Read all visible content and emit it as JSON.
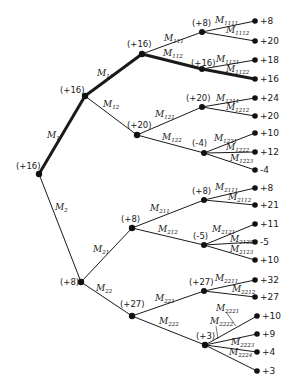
{
  "diagram": {
    "type": "game-tree",
    "root": {
      "id": "root",
      "value": "(+16)"
    },
    "nodes": [
      {
        "id": "root",
        "value": "(+16)",
        "x": 39,
        "y": 174
      },
      {
        "id": "n1",
        "value": "(+16)",
        "x": 85,
        "y": 96
      },
      {
        "id": "n11",
        "value": "(+16)",
        "x": 142,
        "y": 54
      },
      {
        "id": "n111",
        "value": "(+8)",
        "x": 202,
        "y": 32
      },
      {
        "id": "n112",
        "value": "(+16)",
        "x": 202,
        "y": 69
      },
      {
        "id": "n12",
        "value": "(+20)",
        "x": 137,
        "y": 135
      },
      {
        "id": "n121",
        "value": "(+20)",
        "x": 202,
        "y": 107
      },
      {
        "id": "n122",
        "value": "(-4)",
        "x": 204,
        "y": 153
      },
      {
        "id": "n2",
        "value": "(+8)",
        "x": 81,
        "y": 282
      },
      {
        "id": "n21",
        "value": "(+8)",
        "x": 132,
        "y": 228
      },
      {
        "id": "n211",
        "value": "(+8)",
        "x": 204,
        "y": 200
      },
      {
        "id": "n212",
        "value": "(-5)",
        "x": 204,
        "y": 245
      },
      {
        "id": "n22",
        "value": "(+27)",
        "x": 132,
        "y": 316
      },
      {
        "id": "n221",
        "value": "(+27)",
        "x": 204,
        "y": 291
      },
      {
        "id": "n222",
        "value": "(+3)",
        "x": 205,
        "y": 345
      }
    ],
    "leaves": [
      {
        "parent": "n111",
        "value": "+8",
        "x": 255,
        "y": 21
      },
      {
        "parent": "n111",
        "value": "+20",
        "x": 255,
        "y": 41
      },
      {
        "parent": "n112",
        "value": "+18",
        "x": 255,
        "y": 60
      },
      {
        "parent": "n112",
        "value": "+16",
        "x": 255,
        "y": 79
      },
      {
        "parent": "n121",
        "value": "+24",
        "x": 255,
        "y": 98
      },
      {
        "parent": "n121",
        "value": "+20",
        "x": 255,
        "y": 116
      },
      {
        "parent": "n122",
        "value": "+10",
        "x": 255,
        "y": 133
      },
      {
        "parent": "n122",
        "value": "+12",
        "x": 255,
        "y": 152
      },
      {
        "parent": "n122",
        "value": "-4",
        "x": 255,
        "y": 170
      },
      {
        "parent": "n211",
        "value": "+8",
        "x": 255,
        "y": 188
      },
      {
        "parent": "n211",
        "value": "+21",
        "x": 255,
        "y": 205
      },
      {
        "parent": "n212",
        "value": "+11",
        "x": 255,
        "y": 224
      },
      {
        "parent": "n212",
        "value": "-5",
        "x": 255,
        "y": 242
      },
      {
        "parent": "n212",
        "value": "+10",
        "x": 255,
        "y": 260
      },
      {
        "parent": "n221",
        "value": "+32",
        "x": 255,
        "y": 280
      },
      {
        "parent": "n221",
        "value": "+27",
        "x": 255,
        "y": 297
      },
      {
        "parent": "n222",
        "value": "+10",
        "x": 257,
        "y": 316
      },
      {
        "parent": "n222",
        "value": "+9",
        "x": 257,
        "y": 334
      },
      {
        "parent": "n222",
        "value": "+4",
        "x": 257,
        "y": 352
      },
      {
        "parent": "n222",
        "value": "+3",
        "x": 257,
        "y": 371
      }
    ],
    "move_labels": {
      "M1": {
        "base": "M",
        "sub": "1"
      },
      "M2": {
        "base": "M",
        "sub": "2"
      },
      "M11": {
        "base": "M",
        "sub": "11"
      },
      "M12": {
        "base": "M",
        "sub": "12"
      },
      "M21": {
        "base": "M",
        "sub": "21"
      },
      "M22": {
        "base": "M",
        "sub": "22"
      },
      "M111": {
        "base": "M",
        "sub": "111"
      },
      "M112": {
        "base": "M",
        "sub": "112"
      },
      "M121": {
        "base": "M",
        "sub": "121"
      },
      "M122": {
        "base": "M",
        "sub": "122"
      },
      "M211": {
        "base": "M",
        "sub": "211"
      },
      "M212": {
        "base": "M",
        "sub": "212"
      },
      "M221": {
        "base": "M",
        "sub": "221"
      },
      "M222": {
        "base": "M",
        "sub": "222"
      },
      "M1111": {
        "base": "M",
        "sub": "1111"
      },
      "M1112": {
        "base": "M",
        "sub": "1112"
      },
      "M1121": {
        "base": "M",
        "sub": "1121"
      },
      "M1122": {
        "base": "M",
        "sub": "1122"
      },
      "M1211": {
        "base": "M",
        "sub": "1211"
      },
      "M1212": {
        "base": "M",
        "sub": "1212"
      },
      "M1221": {
        "base": "M",
        "sub": "1221"
      },
      "M1222": {
        "base": "M",
        "sub": "1222"
      },
      "M1223": {
        "base": "M",
        "sub": "1223"
      },
      "M2111": {
        "base": "M",
        "sub": "2111"
      },
      "M2112": {
        "base": "M",
        "sub": "2112"
      },
      "M2121": {
        "base": "M",
        "sub": "2121"
      },
      "M2122": {
        "base": "M",
        "sub": "2122"
      },
      "M2123": {
        "base": "M",
        "sub": "2123"
      },
      "M2211": {
        "base": "M",
        "sub": "2211"
      },
      "M2212": {
        "base": "M",
        "sub": "2212"
      },
      "M2221": {
        "base": "M",
        "sub": "2221"
      },
      "M2222": {
        "base": "M",
        "sub": "2222"
      },
      "M2223": {
        "base": "M",
        "sub": "2223"
      },
      "M2224": {
        "base": "M",
        "sub": "2224"
      }
    },
    "principal_variation": [
      "M1",
      "M11",
      "M112",
      "M1122"
    ],
    "principal_value": "+16"
  }
}
